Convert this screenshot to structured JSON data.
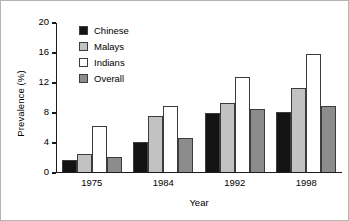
{
  "chart_data": {
    "type": "bar",
    "title": "",
    "xlabel": "Year",
    "ylabel": "Prevalence (%)",
    "categories": [
      "1975",
      "1984",
      "1992",
      "1998"
    ],
    "series": [
      {
        "name": "Chinese",
        "color": "#141414",
        "values": [
          1.6,
          4.0,
          7.9,
          8.0
        ]
      },
      {
        "name": "Malays",
        "color": "#c2c2c2",
        "values": [
          2.4,
          7.5,
          9.3,
          11.2
        ]
      },
      {
        "name": "Indians",
        "color": "#ffffff",
        "values": [
          6.1,
          8.8,
          12.7,
          15.8
        ]
      },
      {
        "name": "Overall",
        "color": "#8c8c8c",
        "values": [
          2.0,
          4.6,
          8.5,
          8.9
        ]
      }
    ],
    "ylim": [
      0,
      20
    ],
    "yticks": [
      0,
      4,
      8,
      12,
      16,
      20
    ],
    "ytick_labels": [
      "0",
      "4",
      "8",
      "12",
      "16",
      "20"
    ],
    "grid": false,
    "legend_position": "upper-left-inside"
  }
}
